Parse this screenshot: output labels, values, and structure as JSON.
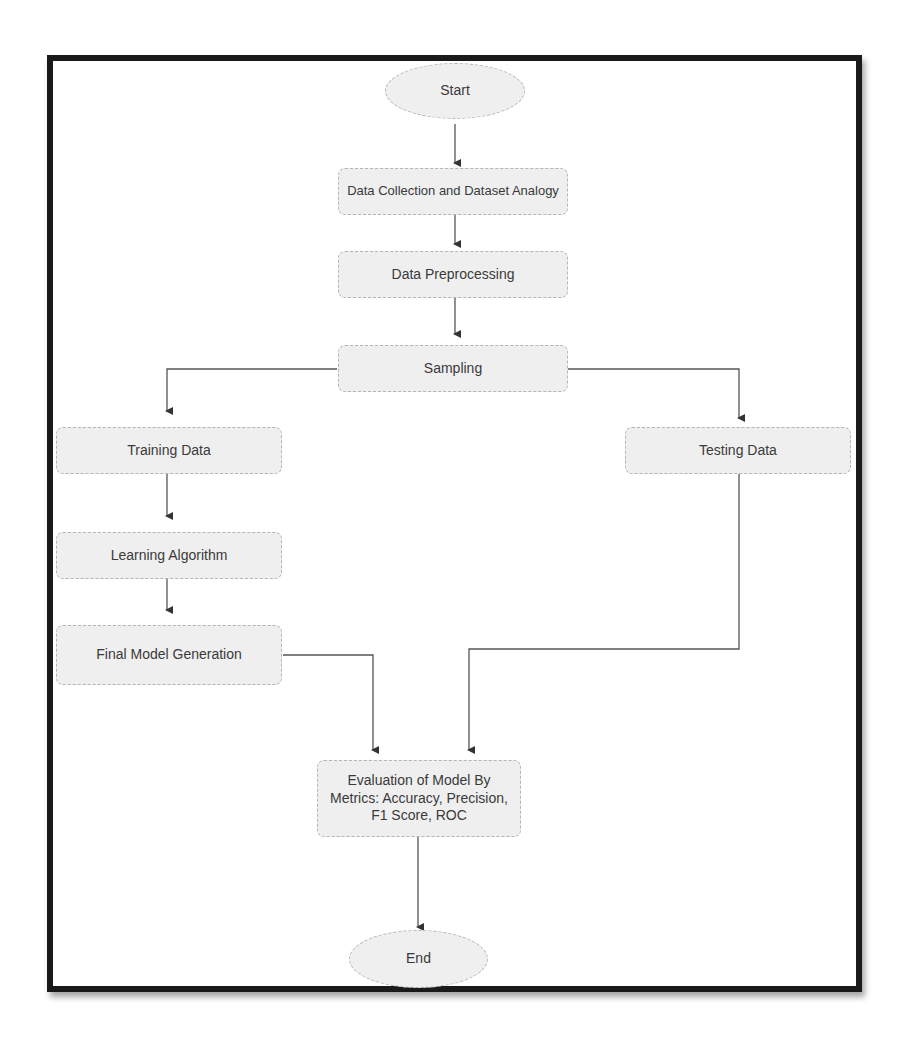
{
  "diagram": {
    "type": "flowchart",
    "nodes": {
      "start": {
        "label": "Start",
        "shape": "ellipse"
      },
      "data_collection": {
        "label": "Data Collection and Dataset Analogy",
        "shape": "rounded-rect"
      },
      "preprocessing": {
        "label": "Data Preprocessing",
        "shape": "rounded-rect"
      },
      "sampling": {
        "label": "Sampling",
        "shape": "rounded-rect"
      },
      "training": {
        "label": "Training Data",
        "shape": "rounded-rect"
      },
      "testing": {
        "label": "Testing Data",
        "shape": "rounded-rect"
      },
      "learning": {
        "label": "Learning Algorithm",
        "shape": "rounded-rect"
      },
      "final_model": {
        "label": "Final Model Generation",
        "shape": "rounded-rect"
      },
      "evaluation": {
        "label": "Evaluation of Model By Metrics: Accuracy, Precision, F1 Score, ROC",
        "shape": "rounded-rect"
      },
      "end": {
        "label": "End",
        "shape": "ellipse"
      }
    },
    "edges": [
      [
        "start",
        "data_collection"
      ],
      [
        "data_collection",
        "preprocessing"
      ],
      [
        "preprocessing",
        "sampling"
      ],
      [
        "sampling",
        "training"
      ],
      [
        "sampling",
        "testing"
      ],
      [
        "training",
        "learning"
      ],
      [
        "learning",
        "final_model"
      ],
      [
        "final_model",
        "evaluation"
      ],
      [
        "testing",
        "evaluation"
      ],
      [
        "evaluation",
        "end"
      ]
    ]
  }
}
